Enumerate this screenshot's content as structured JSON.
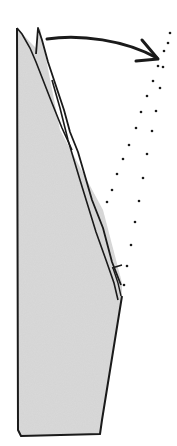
{
  "diagram": {
    "type": "origami-fold-step",
    "colors": {
      "paper_fill": "#d9d9d9",
      "outline": "#1a1a1a",
      "background": "#ffffff"
    },
    "elements": {
      "paper": "folded-paper",
      "arrow": "fold-arrow",
      "dotted_lines": "fold-guide-dotted-lines"
    }
  }
}
